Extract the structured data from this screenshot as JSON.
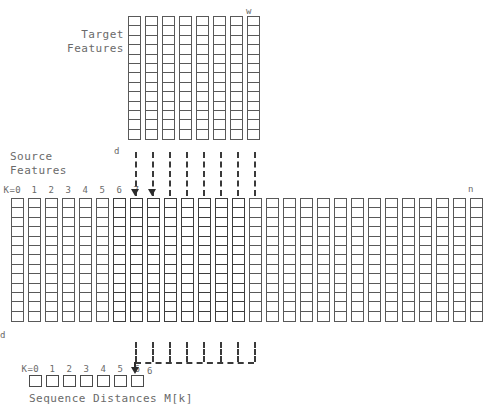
{
  "figure": {
    "title_texts": {
      "target_features": "Target\nFeatures",
      "source_features": "Source\nFeatures",
      "sequence_distances": "Sequence Distances M[k]"
    },
    "axis_labels": {
      "target_depth": "d",
      "target_width": "w",
      "source_depth": "d",
      "source_end": "n",
      "k_prefix": "K=0"
    },
    "source_k_ticks": [
      "K=0",
      "1",
      "2",
      "3",
      "4",
      "5",
      "6",
      "7"
    ],
    "distance_k_ticks": [
      "K=0",
      "1",
      "2",
      "3",
      "4",
      "5",
      "6"
    ],
    "arrow_target_index": "6",
    "colors": {
      "cell_border": "#595959",
      "highlight_border": "#3d3d3d",
      "dashed_line": "#3a3a3a",
      "text": "#6a6a6a",
      "arrow": "#2b2b2b",
      "background": "#ffffff"
    },
    "target_grid": {
      "columns": 8,
      "rows": 13,
      "cell_width": 13,
      "cell_height": 11,
      "col_gap": 4,
      "origin_x": 128,
      "origin_y": 16
    },
    "source_grid": {
      "columns": 28,
      "rows": 13,
      "cell_width": 13,
      "cell_height": 11,
      "col_gap": 4,
      "origin_x": 11,
      "origin_y": 198,
      "highlight_start": 6,
      "highlight_count": 8
    },
    "distance_row": {
      "boxes": 7,
      "box_width": 13,
      "box_height": 12,
      "gap": 4,
      "origin_x": 29,
      "origin_y": 375
    },
    "connectors": {
      "count": 8,
      "upper_top": 152,
      "upper_bottom": 196,
      "lower_top": 342,
      "lower_bottom": 362,
      "bracket_y": 362
    }
  }
}
